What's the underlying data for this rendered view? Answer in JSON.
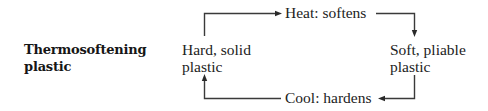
{
  "title": {
    "line1": "Thermosoftening",
    "line2": "plastic"
  },
  "nodes": [
    {
      "id": "hard",
      "line1": "Hard, solid",
      "line2": "plastic"
    },
    {
      "id": "soft",
      "line1": "Soft, pliable",
      "line2": "plastic"
    }
  ],
  "transitions": [
    {
      "id": "heat",
      "label": "Heat: softens",
      "from": "hard",
      "to": "soft"
    },
    {
      "id": "cool",
      "label": "Cool: hardens",
      "from": "soft",
      "to": "hard"
    }
  ],
  "colors": {
    "text": "#222222",
    "line": "#3a3a3a",
    "background": "#ffffff"
  }
}
